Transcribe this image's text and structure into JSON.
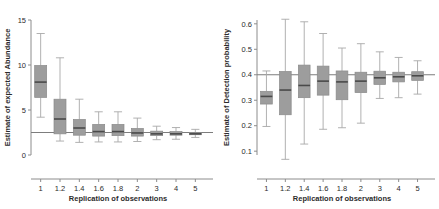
{
  "figure": {
    "panels": [
      "abundance",
      "detection"
    ]
  },
  "chart_data": [
    {
      "type": "box",
      "panel_id": "abundance",
      "title": "",
      "xlabel": "Replication of observations",
      "ylabel": "Estimate of expected Abundance",
      "categories": [
        "1",
        "1.2",
        "1.4",
        "1.6",
        "1.8",
        "2",
        "3",
        "4",
        "5"
      ],
      "xtick_labels": [
        "1",
        "1.2",
        "1.4",
        "1.6",
        "1.8",
        "2",
        "3",
        "4",
        "5"
      ],
      "ytick_labels": [
        "0",
        "5",
        "10",
        "15"
      ],
      "yticks": [
        0,
        5,
        10,
        15
      ],
      "ylim": [
        0,
        15
      ],
      "grid": false,
      "legend": "none",
      "reference_line": {
        "y": 2.5,
        "orientation": "horizontal"
      },
      "boxes": [
        {
          "category": "1",
          "whisker_low": 4.2,
          "q1": 6.4,
          "median": 8.1,
          "q3": 9.95,
          "whisker_high": 13.5
        },
        {
          "category": "1.2",
          "whisker_low": 1.55,
          "q1": 2.35,
          "median": 4.0,
          "q3": 6.2,
          "whisker_high": 10.8
        },
        {
          "category": "1.4",
          "whisker_low": 1.4,
          "q1": 2.2,
          "median": 3.0,
          "q3": 3.95,
          "whisker_high": 6.2
        },
        {
          "category": "1.6",
          "whisker_low": 1.45,
          "q1": 2.1,
          "median": 2.6,
          "q3": 3.4,
          "whisker_high": 4.8
        },
        {
          "category": "1.8",
          "whisker_low": 1.45,
          "q1": 2.15,
          "median": 2.6,
          "q3": 3.4,
          "whisker_high": 4.8
        },
        {
          "category": "2",
          "whisker_low": 1.5,
          "q1": 2.1,
          "median": 2.45,
          "q3": 2.95,
          "whisker_high": 4.1
        },
        {
          "category": "3",
          "whisker_low": 1.7,
          "q1": 2.15,
          "median": 2.35,
          "q3": 2.65,
          "whisker_high": 3.2
        },
        {
          "category": "4",
          "whisker_low": 1.75,
          "q1": 2.2,
          "median": 2.35,
          "q3": 2.6,
          "whisker_high": 3.05
        },
        {
          "category": "5",
          "whisker_low": 1.95,
          "q1": 2.25,
          "median": 2.35,
          "q3": 2.5,
          "whisker_high": 2.85
        }
      ]
    },
    {
      "type": "box",
      "panel_id": "detection",
      "title": "",
      "xlabel": "Replication of observations",
      "ylabel": "Estimate of Detection probability",
      "categories": [
        "1",
        "1.2",
        "1.4",
        "1.6",
        "1.8",
        "2",
        "3",
        "4",
        "5"
      ],
      "xtick_labels": [
        "1",
        "1.2",
        "1.4",
        "1.6",
        "1.8",
        "2",
        "3",
        "4",
        "5"
      ],
      "ytick_labels": [
        "0.1",
        "0.2",
        "0.3",
        "0.4",
        "0.5",
        "0.6"
      ],
      "yticks": [
        0.1,
        0.2,
        0.3,
        0.4,
        0.5,
        0.6
      ],
      "ylim": [
        0.085,
        0.615
      ],
      "grid": false,
      "legend": "none",
      "reference_line": {
        "y": 0.4,
        "orientation": "horizontal"
      },
      "boxes": [
        {
          "category": "1",
          "whisker_low": 0.197,
          "q1": 0.285,
          "median": 0.315,
          "q3": 0.335,
          "whisker_high": 0.415
        },
        {
          "category": "1.2",
          "whisker_low": 0.068,
          "q1": 0.243,
          "median": 0.34,
          "q3": 0.413,
          "whisker_high": 0.618
        },
        {
          "category": "1.4",
          "whisker_low": 0.128,
          "q1": 0.31,
          "median": 0.358,
          "q3": 0.438,
          "whisker_high": 0.608
        },
        {
          "category": "1.6",
          "whisker_low": 0.186,
          "q1": 0.32,
          "median": 0.375,
          "q3": 0.434,
          "whisker_high": 0.562
        },
        {
          "category": "1.8",
          "whisker_low": 0.192,
          "q1": 0.302,
          "median": 0.372,
          "q3": 0.415,
          "whisker_high": 0.505
        },
        {
          "category": "2",
          "whisker_low": 0.21,
          "q1": 0.33,
          "median": 0.375,
          "q3": 0.41,
          "whisker_high": 0.522
        },
        {
          "category": "3",
          "whisker_low": 0.307,
          "q1": 0.362,
          "median": 0.388,
          "q3": 0.414,
          "whisker_high": 0.49
        },
        {
          "category": "4",
          "whisker_low": 0.31,
          "q1": 0.372,
          "median": 0.392,
          "q3": 0.41,
          "whisker_high": 0.468
        },
        {
          "category": "5",
          "whisker_low": 0.324,
          "q1": 0.378,
          "median": 0.396,
          "q3": 0.412,
          "whisker_high": 0.455
        }
      ]
    }
  ]
}
